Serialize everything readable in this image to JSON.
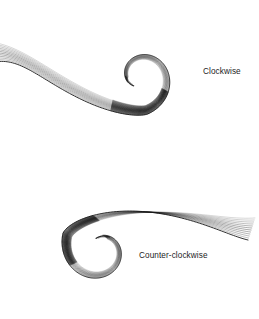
{
  "figure": {
    "width": 259,
    "height": 319,
    "background": "#ffffff",
    "ink_color": "#1a1a1a"
  },
  "captions": {
    "clockwise": "Clockwise",
    "counter_clockwise": "Counter-clockwise"
  },
  "spirals": [
    {
      "name": "clockwise-spiral",
      "direction": "clockwise",
      "center_x": 140,
      "center_y": 76,
      "start_radius": 62,
      "end_radius": 13,
      "start_angle_deg": 152,
      "sweep_deg": 430,
      "band_count": 12,
      "band_spread": 13.5,
      "mirror": false,
      "tail_x": -6,
      "tail_y": 62,
      "shade_start_deg": 250,
      "shade_end_deg": 330
    },
    {
      "name": "counter-clockwise-spiral",
      "direction": "counter-clockwise",
      "center_x": 101,
      "center_y": 250,
      "start_radius": 66,
      "end_radius": 14,
      "start_angle_deg": 152,
      "sweep_deg": 430,
      "band_count": 12,
      "band_spread": 14.5,
      "mirror": true,
      "tail_x": 248,
      "tail_y": 240,
      "shade_start_deg": 250,
      "shade_end_deg": 330
    }
  ],
  "stroke_widths": {
    "outer": 0.95,
    "inner": 0.42,
    "hook": 1.25
  }
}
